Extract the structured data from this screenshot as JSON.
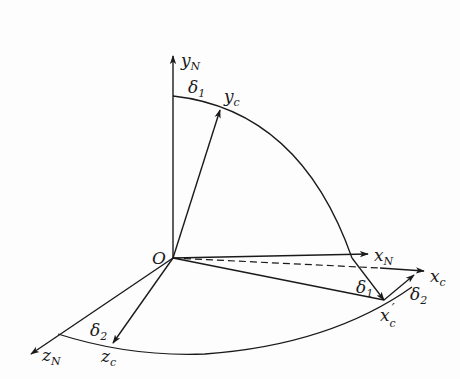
{
  "diagram": {
    "type": "coordinate-frame-rotation",
    "origin_label": "O",
    "axes": {
      "y_N": {
        "base": "y",
        "sub": "N"
      },
      "x_N": {
        "base": "x",
        "sub": "N"
      },
      "z_N": {
        "base": "z",
        "sub": "N"
      },
      "y_c": {
        "base": "y",
        "sub": "c"
      },
      "x_c": {
        "base": "x",
        "sub": "c"
      },
      "z_c": {
        "base": "z",
        "sub": "c"
      },
      "x_c_prime": {
        "base": "x",
        "sub": "c",
        "prime": "′"
      }
    },
    "angles": {
      "delta1_top": {
        "base": "δ",
        "sub": "1"
      },
      "delta1_right": {
        "base": "δ",
        "sub": "1"
      },
      "delta2_right": {
        "base": "δ",
        "sub": "2"
      },
      "delta2_bottom": {
        "base": "δ",
        "sub": "2"
      }
    },
    "colors": {
      "stroke": "#1a1a1a",
      "background": "#fdfdfd"
    }
  }
}
